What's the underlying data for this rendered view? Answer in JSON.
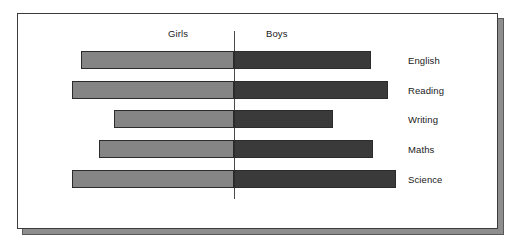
{
  "chart_data": {
    "type": "bar",
    "orientation": "horizontal",
    "style": "diverging-bidirectional",
    "title": "",
    "xlabel": "",
    "ylabel": "",
    "grid": false,
    "legend_position": "top",
    "categories": [
      "English",
      "Reading",
      "Writing",
      "Maths",
      "Science"
    ],
    "series": [
      {
        "name": "Girls",
        "direction": "left",
        "color": "#858585",
        "values": [
          153,
          162,
          120,
          135,
          162
        ]
      },
      {
        "name": "Boys",
        "direction": "right",
        "color": "#3a3a3a",
        "values": [
          137,
          154,
          99,
          139,
          162
        ]
      }
    ],
    "axis_center_label": "0"
  },
  "chart": {
    "headers": {
      "left_group": "Girls",
      "right_group": "Boys"
    },
    "rows": [
      {
        "label": "English",
        "girls_start": 63,
        "girls_end": 216,
        "boys_start": 216,
        "boys_end": 353
      },
      {
        "label": "Reading",
        "girls_start": 54,
        "girls_end": 216,
        "boys_start": 216,
        "boys_end": 370
      },
      {
        "label": "Writing",
        "girls_start": 96,
        "girls_end": 216,
        "boys_start": 216,
        "boys_end": 315
      },
      {
        "label": "Maths",
        "girls_start": 81,
        "girls_end": 216,
        "boys_start": 216,
        "boys_end": 355
      },
      {
        "label": "Science",
        "girls_start": 54,
        "girls_end": 216,
        "boys_start": 216,
        "boys_end": 378
      }
    ],
    "row_tops": [
      37,
      67,
      96,
      126,
      156
    ],
    "colors": {
      "girls_bar": "#858585",
      "boys_bar": "#3a3a3a",
      "bar_outline": "#2b2b2b",
      "divider": "#4a4a4a",
      "panel_background": "#ffffff",
      "panel_border": "#3c3c3c",
      "shadow": "#8e8e8e"
    }
  }
}
